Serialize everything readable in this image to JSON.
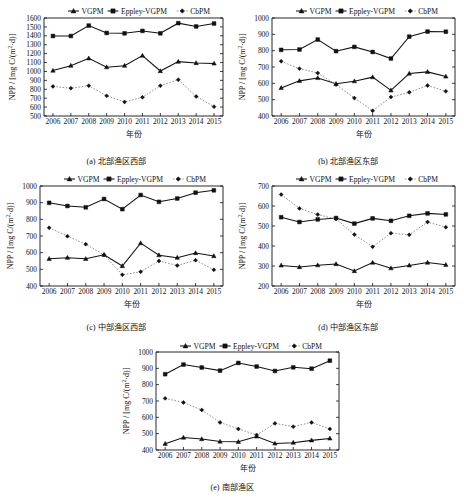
{
  "figure": {
    "axis_labels": {
      "x": "年份",
      "y": "NPP / [mg C/(m2·d)]",
      "y_parts": {
        "prefix": "NPP / [mg C/(m",
        "sup": "2",
        "suffix": "·d)]"
      }
    },
    "legend": [
      {
        "label": "VGPM",
        "marker": "triangle",
        "line": "solid",
        "color": "#111111"
      },
      {
        "label": "Eppley-VGPM",
        "marker": "square",
        "line": "solid",
        "color": "#111111"
      },
      {
        "label": "CbPM",
        "marker": "diamond",
        "line": "dotted",
        "color": "#8d8d8d"
      }
    ]
  },
  "chart_data": [
    {
      "id": "a",
      "type": "line",
      "caption": "(a) 北部渔区西部",
      "title": "",
      "xlabel": "年份",
      "ylabel": "NPP / [mg C/(m2·d)]",
      "categories": [
        "2006",
        "2007",
        "2008",
        "2009",
        "2010",
        "2011",
        "2012",
        "2013",
        "2014",
        "2015"
      ],
      "x": [
        2006,
        2007,
        2008,
        2009,
        2010,
        2011,
        2012,
        2013,
        2014,
        2015
      ],
      "ylim": [
        500,
        1600
      ],
      "yticks": [
        500,
        600,
        700,
        800,
        900,
        1000,
        1100,
        1200,
        1300,
        1400,
        1500,
        1600
      ],
      "grid": false,
      "legend_position": "top",
      "series": [
        {
          "name": "VGPM",
          "values": [
            1010,
            1065,
            1148,
            1048,
            1065,
            1178,
            1005,
            1110,
            1095,
            1090
          ]
        },
        {
          "name": "Eppley-VGPM",
          "values": [
            1398,
            1398,
            1515,
            1432,
            1428,
            1455,
            1428,
            1542,
            1505,
            1538
          ]
        },
        {
          "name": "CbPM",
          "values": [
            832,
            812,
            840,
            726,
            658,
            710,
            840,
            908,
            720,
            605
          ]
        }
      ]
    },
    {
      "id": "b",
      "type": "line",
      "caption": "(b) 北部渔区东部",
      "title": "",
      "xlabel": "年份",
      "ylabel": "NPP / [mg C/(m2·d)]",
      "categories": [
        "2006",
        "2007",
        "2008",
        "2009",
        "2010",
        "2011",
        "2012",
        "2013",
        "2014",
        "2015"
      ],
      "x": [
        2006,
        2007,
        2008,
        2009,
        2010,
        2011,
        2012,
        2013,
        2014,
        2015
      ],
      "ylim": [
        400,
        1000
      ],
      "yticks": [
        400,
        500,
        600,
        700,
        800,
        900,
        1000
      ],
      "grid": false,
      "legend_position": "top",
      "series": [
        {
          "name": "VGPM",
          "values": [
            572,
            615,
            633,
            597,
            613,
            638,
            557,
            660,
            670,
            642
          ]
        },
        {
          "name": "Eppley-VGPM",
          "values": [
            805,
            807,
            868,
            797,
            823,
            792,
            752,
            886,
            917,
            916
          ]
        },
        {
          "name": "CbPM",
          "values": [
            735,
            690,
            663,
            592,
            510,
            432,
            516,
            545,
            587,
            551
          ]
        }
      ]
    },
    {
      "id": "c",
      "type": "line",
      "caption": "(c) 中部渔区西部",
      "title": "",
      "xlabel": "年份",
      "ylabel": "NPP / [mg C/(m2·d)]",
      "categories": [
        "2006",
        "2007",
        "2008",
        "2009",
        "2010",
        "2011",
        "2012",
        "2013",
        "2014",
        "2015"
      ],
      "x": [
        2006,
        2007,
        2008,
        2009,
        2010,
        2011,
        2012,
        2013,
        2014,
        2015
      ],
      "ylim": [
        400,
        1000
      ],
      "yticks": [
        400,
        500,
        600,
        700,
        800,
        900,
        1000
      ],
      "grid": false,
      "legend_position": "top",
      "series": [
        {
          "name": "VGPM",
          "values": [
            563,
            570,
            563,
            587,
            520,
            657,
            585,
            570,
            598,
            580
          ]
        },
        {
          "name": "Eppley-VGPM",
          "values": [
            899,
            880,
            872,
            922,
            861,
            946,
            905,
            925,
            960,
            974
          ]
        },
        {
          "name": "CbPM",
          "values": [
            749,
            699,
            651,
            587,
            467,
            485,
            550,
            523,
            555,
            497
          ]
        }
      ]
    },
    {
      "id": "d",
      "type": "line",
      "caption": "(d) 中部渔区东部",
      "title": "",
      "xlabel": "年份",
      "ylabel": "NPP / [mg C/(m2·d)]",
      "categories": [
        "2006",
        "2007",
        "2008",
        "2009",
        "2010",
        "2011",
        "2012",
        "2013",
        "2014",
        "2015"
      ],
      "x": [
        2006,
        2007,
        2008,
        2009,
        2010,
        2011,
        2012,
        2013,
        2014,
        2015
      ],
      "ylim": [
        200,
        700
      ],
      "yticks": [
        200,
        300,
        400,
        500,
        600,
        700
      ],
      "grid": false,
      "legend_position": "top",
      "series": [
        {
          "name": "VGPM",
          "values": [
            303,
            295,
            304,
            310,
            275,
            317,
            289,
            303,
            317,
            306
          ]
        },
        {
          "name": "Eppley-VGPM",
          "values": [
            544,
            520,
            533,
            540,
            512,
            538,
            526,
            551,
            563,
            558
          ]
        },
        {
          "name": "CbPM",
          "values": [
            657,
            588,
            557,
            535,
            457,
            396,
            464,
            456,
            520,
            494
          ]
        }
      ]
    },
    {
      "id": "e",
      "type": "line",
      "caption": "(e) 南部渔区",
      "title": "",
      "xlabel": "年份",
      "ylabel": "NPP / [mg C/(m2·d)]",
      "categories": [
        "2006",
        "2007",
        "2008",
        "2009",
        "2010",
        "2011",
        "2012",
        "2013",
        "2014",
        "2015"
      ],
      "x": [
        2006,
        2007,
        2008,
        2009,
        2010,
        2011,
        2012,
        2013,
        2014,
        2015
      ],
      "ylim": [
        400,
        1000
      ],
      "yticks": [
        400,
        500,
        600,
        700,
        800,
        900,
        1000
      ],
      "grid": false,
      "legend_position": "top",
      "series": [
        {
          "name": "VGPM",
          "values": [
            438,
            476,
            467,
            452,
            450,
            483,
            440,
            445,
            459,
            471
          ]
        },
        {
          "name": "Eppley-VGPM",
          "values": [
            864,
            923,
            905,
            886,
            933,
            911,
            884,
            906,
            898,
            947
          ]
        },
        {
          "name": "CbPM",
          "values": [
            716,
            691,
            645,
            569,
            529,
            492,
            563,
            543,
            569,
            529
          ]
        }
      ]
    }
  ]
}
